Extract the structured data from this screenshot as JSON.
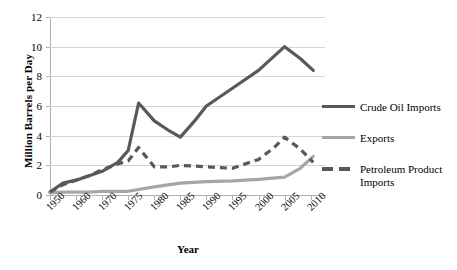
{
  "chart_data": {
    "type": "line",
    "title": "",
    "xlabel": "Year",
    "ylabel": "Million Barrels per Day",
    "categories": [
      "1950",
      "1960",
      "1970",
      "1975",
      "1980",
      "1985",
      "1990",
      "1995",
      "2000",
      "2005",
      "2010"
    ],
    "x_tick_labels": [
      "1950",
      "1960",
      "1970",
      "1975",
      "1980",
      "1985",
      "1990",
      "1995",
      "2000",
      "2005",
      "2010"
    ],
    "y_tick_labels": [
      "0",
      "2",
      "4",
      "6",
      "8",
      "10",
      "12"
    ],
    "ylim": [
      0,
      12
    ],
    "y_step": 2,
    "grid": "horizontal",
    "legend_position": "right",
    "series": [
      {
        "name": "Crude Oil Imports",
        "style": "solid",
        "color": "#595959",
        "x": [
          1950,
          1955,
          1960,
          1965,
          1970,
          1973,
          1975,
          1977,
          1980,
          1983,
          1985,
          1988,
          1990,
          1995,
          2000,
          2005,
          2008,
          2011
        ],
        "values": [
          0.2,
          0.8,
          1.0,
          1.3,
          1.6,
          2.2,
          3.0,
          6.2,
          5.0,
          4.3,
          3.9,
          5.1,
          6.0,
          7.2,
          8.4,
          10.0,
          9.2,
          8.4
        ]
      },
      {
        "name": "Exports",
        "style": "solid",
        "color": "#a6a6a6",
        "x": [
          1950,
          1955,
          1960,
          1965,
          1970,
          1975,
          1980,
          1985,
          1990,
          1995,
          2000,
          2005,
          2008,
          2011
        ],
        "values": [
          0.15,
          0.2,
          0.2,
          0.2,
          0.25,
          0.25,
          0.55,
          0.8,
          0.9,
          0.95,
          1.05,
          1.2,
          1.8,
          2.6
        ]
      },
      {
        "name": "Petroleum Product Imports",
        "style": "dashed",
        "color": "#595959",
        "x": [
          1950,
          1955,
          1960,
          1965,
          1970,
          1973,
          1975,
          1977,
          1980,
          1983,
          1985,
          1990,
          1995,
          2000,
          2003,
          2005,
          2008,
          2011
        ],
        "values": [
          0.2,
          0.7,
          1.0,
          1.3,
          1.7,
          2.1,
          2.3,
          3.2,
          1.9,
          1.9,
          2.0,
          1.9,
          1.8,
          2.4,
          3.2,
          3.9,
          3.1,
          2.2
        ]
      }
    ]
  },
  "legend": {
    "items": [
      {
        "label": "Crude Oil Imports"
      },
      {
        "label": "Exports"
      },
      {
        "label": "Petroleum Product Imports"
      }
    ]
  }
}
